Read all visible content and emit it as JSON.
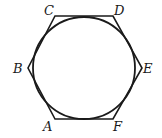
{
  "diagram": {
    "type": "geometry",
    "stroke_color": "#1a1a1a",
    "background": "#ffffff",
    "circle": {
      "cx": 84,
      "cy": 68,
      "r": 51
    },
    "vertices": [
      {
        "name": "A",
        "x": 55,
        "y": 119,
        "label_x": 43,
        "label_y": 131
      },
      {
        "name": "B",
        "x": 28,
        "y": 68,
        "label_x": 13,
        "label_y": 73
      },
      {
        "name": "C",
        "x": 55,
        "y": 16,
        "label_x": 44,
        "label_y": 15
      },
      {
        "name": "D",
        "x": 113,
        "y": 16,
        "label_x": 114,
        "label_y": 15
      },
      {
        "name": "E",
        "x": 142,
        "y": 68,
        "label_x": 143,
        "label_y": 73
      },
      {
        "name": "F",
        "x": 113,
        "y": 119,
        "label_x": 113,
        "label_y": 131
      }
    ]
  }
}
